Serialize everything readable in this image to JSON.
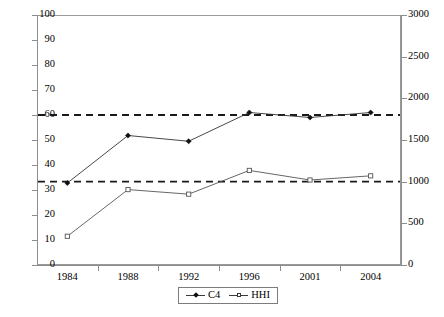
{
  "chart_data": {
    "type": "line",
    "title": "",
    "xlabel": "",
    "ylabel": "",
    "categories": [
      "1984",
      "1988",
      "1992",
      "1996",
      "2001",
      "2004"
    ],
    "grid": false,
    "legend_position": "bottom-center",
    "axes": {
      "left": {
        "label": "",
        "ylim": [
          0,
          100
        ],
        "ticks": [
          "0",
          "10",
          "20",
          "30",
          "40",
          "50",
          "60",
          "70",
          "80",
          "90",
          "100"
        ],
        "tick_values": [
          0,
          10,
          20,
          30,
          40,
          50,
          60,
          70,
          80,
          90,
          100
        ],
        "applies_to": "C4"
      },
      "right": {
        "label": "",
        "ylim": [
          0,
          3000
        ],
        "ticks": [
          "0",
          "500",
          "1000",
          "1500",
          "2000",
          "2500",
          "3000"
        ],
        "tick_values": [
          0,
          500,
          1000,
          1500,
          2000,
          2500,
          3000
        ],
        "applies_to": "HHI"
      }
    },
    "series": [
      {
        "name": "C4",
        "axis": "left",
        "marker": "filled-diamond",
        "color": "#333333",
        "values": [
          32.8,
          51.8,
          49.5,
          61.0,
          59.0,
          61.0
        ]
      },
      {
        "name": "HHI",
        "axis": "right",
        "marker": "open-square",
        "color": "#555555",
        "values": [
          345,
          905,
          850,
          1135,
          1020,
          1070
        ]
      }
    ],
    "reference_lines": [
      {
        "name": "c4-threshold",
        "axis": "left",
        "value": 60,
        "style": "dashed",
        "color": "#1a1a1a"
      },
      {
        "name": "hhi-threshold",
        "axis": "right",
        "value": 1000,
        "left_equivalent": 32.5,
        "style": "dashed",
        "color": "#1a1a1a"
      }
    ],
    "legend": [
      {
        "label": "C4",
        "marker": "filled-diamond"
      },
      {
        "label": "HHI",
        "marker": "open-square"
      }
    ]
  }
}
